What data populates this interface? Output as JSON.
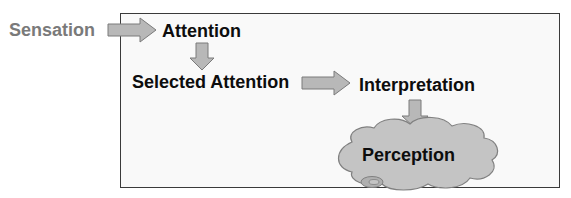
{
  "diagram": {
    "title": "",
    "nodes": {
      "sensation": "Sensation",
      "attention": "Attention",
      "selected_attention": "Selected Attention",
      "interpretation": "Interpretation",
      "perception": "Perception"
    },
    "edges": [
      {
        "from": "Sensation",
        "to": "Attention",
        "direction": "right"
      },
      {
        "from": "Attention",
        "to": "Selected Attention",
        "direction": "down"
      },
      {
        "from": "Selected Attention",
        "to": "Interpretation",
        "direction": "right"
      },
      {
        "from": "Interpretation",
        "to": "Perception",
        "direction": "down"
      }
    ],
    "colors": {
      "arrow_fill": "#b8b8b8",
      "arrow_stroke": "#7a7a7a",
      "cloud_fill": "#c4c4c4",
      "frame_border": "#3a3a3a",
      "sensation_text": "#7a7a7a",
      "text": "#0d0d0d"
    }
  }
}
